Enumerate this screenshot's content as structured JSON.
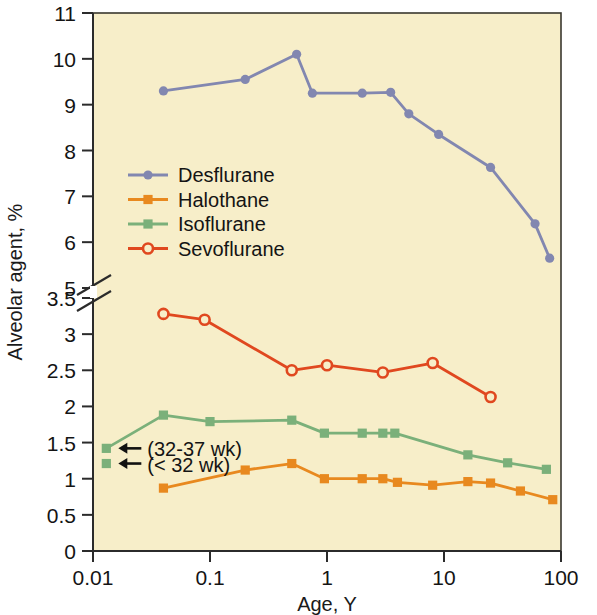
{
  "chart_data": {
    "type": "line",
    "title": "",
    "xlabel": "Age, Y",
    "ylabel": "Alveolar agent, %",
    "xscale": "log",
    "xlim": [
      0.01,
      100
    ],
    "xticks": [
      "0.01",
      "0.1",
      "1",
      "10",
      "100"
    ],
    "xtick_values": [
      0.01,
      0.1,
      1,
      10,
      100
    ],
    "yticks_upper": [
      "11",
      "10",
      "9",
      "8",
      "7",
      "6",
      "5"
    ],
    "ytick_upper_values": [
      11,
      10,
      9,
      8,
      7,
      6,
      5
    ],
    "yticks_lower": [
      "3.5",
      "3",
      "2.5",
      "2",
      "1.5",
      "1",
      "0.5",
      "0"
    ],
    "ytick_lower_values": [
      3.5,
      3,
      2.5,
      2,
      1.5,
      1,
      0.5,
      0
    ],
    "axis_break": true,
    "axis_break_between": [
      5,
      3.5
    ],
    "grid": false,
    "legend_position": "upper-left-inside",
    "plot_background": "#f7eec9",
    "series": [
      {
        "name": "Desflurane",
        "color": "#8287b0",
        "marker": "circle-filled",
        "x": [
          0.04,
          0.2,
          0.55,
          0.75,
          2.0,
          3.5,
          5.0,
          9.0,
          25.0,
          60.0,
          80.0
        ],
        "y": [
          9.3,
          9.55,
          10.1,
          9.25,
          9.25,
          9.27,
          8.8,
          8.35,
          7.63,
          6.4,
          5.65
        ]
      },
      {
        "name": "Halothane",
        "color": "#e8891f",
        "marker": "square-filled",
        "x": [
          0.04,
          0.2,
          0.5,
          0.95,
          2.0,
          3.0,
          4.0,
          8.0,
          16.0,
          25.0,
          45.0,
          85.0
        ],
        "y": [
          0.87,
          1.12,
          1.21,
          1.0,
          1.0,
          1.0,
          0.95,
          0.91,
          0.96,
          0.94,
          0.83,
          0.71
        ]
      },
      {
        "name": "Isoflurane",
        "color": "#7bb07a",
        "marker": "square-filled",
        "x": [
          0.013,
          0.04,
          0.1,
          0.5,
          0.95,
          2.0,
          3.0,
          3.8,
          16.0,
          35.0,
          75.0
        ],
        "y": [
          1.42,
          1.88,
          1.79,
          1.81,
          1.63,
          1.63,
          1.63,
          1.63,
          1.33,
          1.22,
          1.13
        ]
      },
      {
        "name": "Sevoflurane",
        "color": "#e0481f",
        "marker": "circle-open",
        "x": [
          0.04,
          0.09,
          0.5,
          1.0,
          3.0,
          8.0,
          25.0
        ],
        "y": [
          3.28,
          3.2,
          2.5,
          2.57,
          2.47,
          2.6,
          2.13
        ]
      }
    ],
    "isolated_points": [
      {
        "name": "Isoflurane preterm < 32 wk",
        "color": "#7bb07a",
        "marker": "square-filled",
        "x": 0.013,
        "y": 1.21
      }
    ],
    "annotations": [
      {
        "text": "(32-37 wk)",
        "arrow": "left",
        "target_x": 0.013,
        "target_y": 1.42
      },
      {
        "text": "(< 32 wk)",
        "arrow": "left",
        "target_x": 0.013,
        "target_y": 1.21
      }
    ]
  },
  "legend": {
    "entries": [
      {
        "label": "Desflurane",
        "color": "#8287b0",
        "marker": "circle-filled"
      },
      {
        "label": "Halothane",
        "color": "#e8891f",
        "marker": "square-filled"
      },
      {
        "label": "Isoflurane",
        "color": "#7bb07a",
        "marker": "square-filled"
      },
      {
        "label": "Sevoflurane",
        "color": "#e0481f",
        "marker": "circle-open"
      }
    ]
  }
}
